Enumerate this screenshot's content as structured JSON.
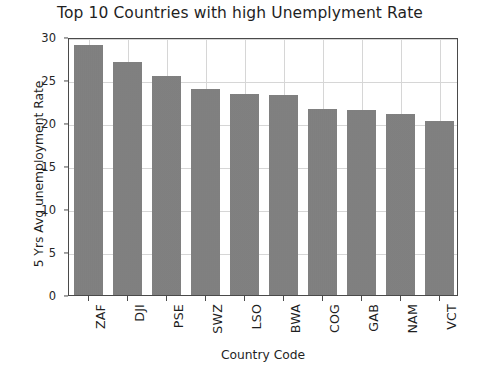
{
  "chart_data": {
    "type": "bar",
    "title": "Top 10 Countries with high Unemplyment Rate",
    "xlabel": "Country Code",
    "ylabel": "5 Yrs Avg unemployment Rate",
    "categories": [
      "ZAF",
      "DJI",
      "PSE",
      "SWZ",
      "LSO",
      "BWA",
      "COG",
      "GAB",
      "NAM",
      "VCT"
    ],
    "values": [
      29.1,
      27.1,
      25.5,
      23.9,
      23.4,
      23.2,
      21.6,
      21.5,
      21.0,
      20.2
    ],
    "ylim": [
      0,
      30
    ],
    "yticks": [
      0,
      5,
      10,
      15,
      20,
      25,
      30
    ],
    "ytick_labels": [
      "0",
      "5",
      "10",
      "15",
      "20",
      "25",
      "30"
    ],
    "grid": true,
    "legend": "none",
    "bar_color": "#7f7f7f",
    "grid_color": "#d6d6d6",
    "axis_color": "#4a4a4a",
    "background": "#ffffff",
    "xtick_rotation": -90
  }
}
